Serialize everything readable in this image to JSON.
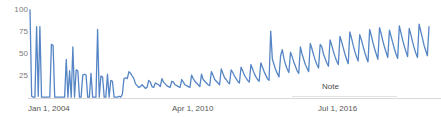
{
  "chart_data": {
    "type": "line",
    "title": "",
    "subtitle": "",
    "xlabel": "",
    "ylabel": "",
    "ylim": [
      0,
      100
    ],
    "grid": false,
    "legend": null,
    "y_ticks": [
      100,
      75,
      50,
      25
    ],
    "x_ticks": [
      "Jan 1, 2004",
      "Apr 1, 2010",
      "Jul 1, 2016"
    ],
    "x_tick_positions_px": [
      30,
      174,
      320
    ],
    "annotations": [
      {
        "label": "Note",
        "x_px": 322,
        "y_px": 82
      }
    ],
    "series": [
      {
        "name": "Search interest",
        "color": "#5585c5",
        "values": [
          100,
          2,
          1,
          1,
          81,
          2,
          81,
          1,
          1,
          1,
          1,
          1,
          1,
          61,
          60,
          1,
          1,
          1,
          1,
          1,
          1,
          1,
          44,
          1,
          31,
          1,
          58,
          1,
          32,
          31,
          1,
          1,
          26,
          27,
          26,
          1,
          1,
          28,
          1,
          1,
          1,
          78,
          1,
          25,
          24,
          1,
          1,
          27,
          1,
          20,
          19,
          1,
          1,
          1,
          2,
          1,
          4,
          22,
          23,
          22,
          30,
          28,
          25,
          22,
          16,
          14,
          12,
          13,
          15,
          13,
          11,
          12,
          20,
          18,
          13,
          12,
          17,
          16,
          15,
          13,
          22,
          18,
          16,
          14,
          13,
          12,
          19,
          18,
          15,
          14,
          13,
          12,
          21,
          18,
          15,
          14,
          13,
          12,
          26,
          22,
          19,
          17,
          15,
          13,
          27,
          21,
          19,
          17,
          15,
          14,
          30,
          26,
          21,
          19,
          17,
          15,
          33,
          28,
          23,
          21,
          18,
          16,
          32,
          29,
          25,
          22,
          19,
          17,
          35,
          31,
          26,
          23,
          20,
          18,
          38,
          33,
          28,
          24,
          21,
          19,
          40,
          35,
          30,
          26,
          22,
          20,
          76,
          44,
          38,
          32,
          28,
          24,
          48,
          55,
          45,
          38,
          33,
          29,
          52,
          47,
          41,
          36,
          31,
          28,
          58,
          50,
          44,
          38,
          34,
          30,
          62,
          56,
          49,
          43,
          38,
          34,
          61,
          58,
          50,
          45,
          40,
          36,
          66,
          60,
          53,
          47,
          42,
          38,
          70,
          64,
          57,
          50,
          44,
          39,
          75,
          68,
          60,
          53,
          47,
          42,
          72,
          66,
          59,
          52,
          46,
          41,
          78,
          71,
          63,
          56,
          50,
          44,
          80,
          73,
          65,
          58,
          52,
          46,
          77,
          70,
          63,
          56,
          50,
          45,
          82,
          74,
          66,
          59,
          53,
          47,
          79,
          72,
          64,
          57,
          51,
          46,
          84,
          76,
          68,
          60,
          54,
          48,
          81
        ]
      }
    ]
  }
}
